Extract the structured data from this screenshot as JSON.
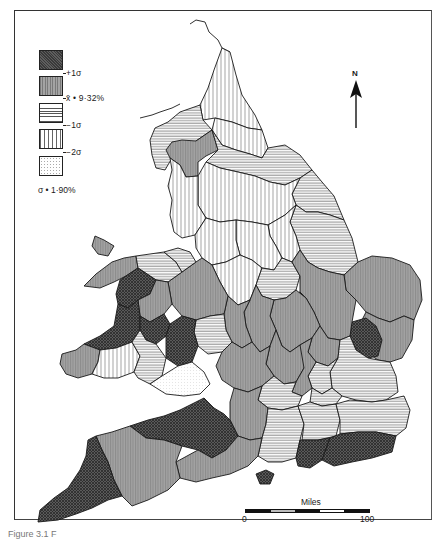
{
  "map": {
    "title": "England and Wales counties choropleth",
    "colors": {
      "plus_one_sigma": "#4a4a4a",
      "mean": "#9a9a9a",
      "minus_one_sigma": "#f2f2f2",
      "minus_two_sigma": "#ffffff",
      "below_minus_two_sigma": "#fafafa",
      "border": "#1a1a1a"
    }
  },
  "legend": {
    "classes": [
      {
        "name": "above-plus-1-sigma",
        "pattern": "dark-crosshatch"
      },
      {
        "name": "mean-to-plus-1-sigma",
        "pattern": "grey-vertical"
      },
      {
        "name": "minus-1-sigma-to-mean",
        "pattern": "horizontal-lines"
      },
      {
        "name": "minus-2-sigma-to-minus-1-sigma",
        "pattern": "vertical-lines"
      },
      {
        "name": "below-minus-2-sigma",
        "pattern": "dotted"
      }
    ],
    "breaks": [
      "+1σ",
      "x̄ • 9·32%",
      "−1σ",
      "−2σ"
    ],
    "sigma_note": "σ • 1·90%"
  },
  "north_arrow": {
    "label": "N"
  },
  "scale_bar": {
    "title": "Miles",
    "min": "0",
    "max": "100"
  },
  "caption": {
    "text": "Figure 3.1  F"
  }
}
